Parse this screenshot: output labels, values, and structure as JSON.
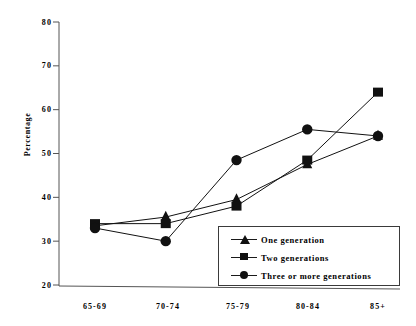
{
  "chart_data": {
    "type": "line",
    "title": "",
    "xlabel": "",
    "ylabel": "Percentage",
    "categories": [
      "65-69",
      "70-74",
      "75-79",
      "80-84",
      "85+"
    ],
    "ylim": [
      20,
      80
    ],
    "yticks": [
      20,
      30,
      40,
      50,
      60,
      70,
      80
    ],
    "grid": false,
    "legend_position": "inside-lower-right",
    "series": [
      {
        "name": "One generation",
        "marker": "triangle",
        "color": "#111111",
        "values": [
          33.5,
          35.5,
          39.5,
          47.5,
          54.0
        ]
      },
      {
        "name": "Two generations",
        "marker": "square",
        "color": "#111111",
        "values": [
          34.0,
          34.0,
          38.0,
          48.5,
          64.0
        ]
      },
      {
        "name": "Three or more generations",
        "marker": "circle",
        "color": "#111111",
        "values": [
          33.0,
          30.0,
          48.5,
          55.5,
          54.0
        ]
      }
    ]
  },
  "axis": {
    "y_tick_labels": [
      "80",
      "70",
      "60",
      "50",
      "40",
      "30",
      "20"
    ],
    "x_tick_labels": [
      "65-69",
      "70-74",
      "75-79",
      "80-84",
      "85+"
    ],
    "y_axis_title": "Percentage"
  },
  "legend": {
    "items": [
      {
        "label": "One generation",
        "marker": "triangle-marker"
      },
      {
        "label": "Two generations",
        "marker": "square-marker"
      },
      {
        "label": "Three or more generations",
        "marker": "circle-marker"
      }
    ]
  }
}
